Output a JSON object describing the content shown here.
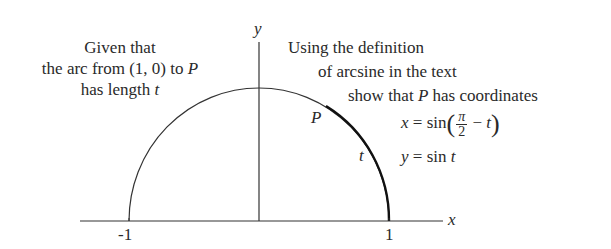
{
  "diagram": {
    "type": "unit-semicircle",
    "axes": {
      "x_label": "x",
      "y_label": "y",
      "ticks": [
        "-1",
        "1"
      ]
    },
    "labels": {
      "point": "P",
      "arc": "t"
    },
    "left_note": {
      "line1": "Given that",
      "line2_prefix": "the arc from (1, 0) to ",
      "line2_var": "P",
      "line3_prefix": "has length ",
      "line3_var": "t"
    },
    "right_note": {
      "line1": "Using the definition",
      "line2": "of arcsine in the text",
      "line3_prefix": "show that ",
      "line3_var": "P",
      "line3_suffix": " has coordinates",
      "eq_x_lhs": "x",
      "eq_x_rhs_fn": "sin",
      "eq_x_frac_num": "π",
      "eq_x_frac_den": "2",
      "eq_x_minus": "−",
      "eq_x_var": "t",
      "eq_y_lhs": "y",
      "eq_y_rhs_fn": "sin",
      "eq_y_var": "t",
      "equals": "="
    },
    "colors": {
      "line": "#333333",
      "text": "#2a2a2a"
    }
  }
}
